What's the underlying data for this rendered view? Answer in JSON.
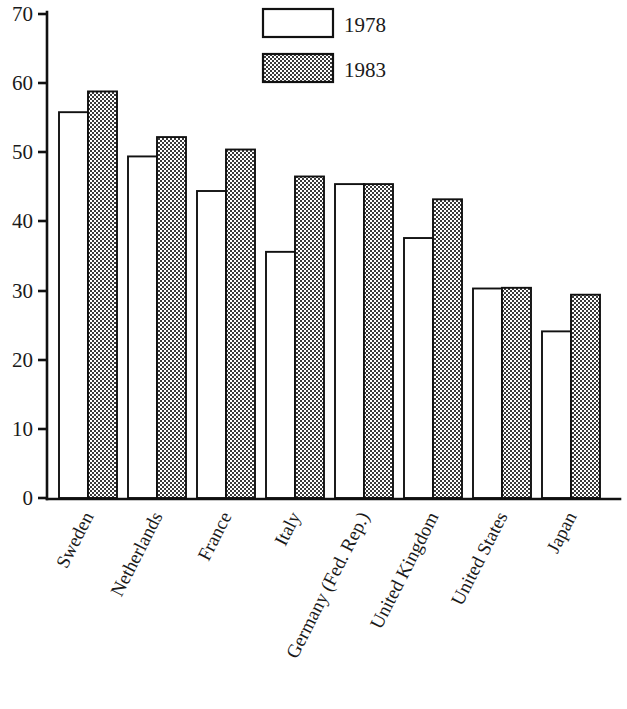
{
  "chart_data": {
    "type": "bar",
    "title": "",
    "subtitle": "",
    "xlabel": "",
    "ylabel": "",
    "ylim": [
      0,
      70
    ],
    "yticks": [
      0,
      10,
      20,
      30,
      40,
      50,
      60,
      70
    ],
    "ytick_labels": [
      "0",
      "10",
      "20",
      "30",
      "40",
      "50",
      "60",
      "70"
    ],
    "grid": false,
    "legend_position": "top-center",
    "categories": [
      "Sweden",
      "Netherlands",
      "France",
      "Italy",
      "Germany (Fed. Rep.)",
      "United Kingdom",
      "United States",
      "Japan"
    ],
    "series": [
      {
        "name": "1978",
        "pattern": "empty",
        "values": [
          55.8,
          49.4,
          44.4,
          35.6,
          45.4,
          37.6,
          30.3,
          24.1
        ]
      },
      {
        "name": "1983",
        "pattern": "stipple",
        "values": [
          58.8,
          52.2,
          50.4,
          46.5,
          45.4,
          43.2,
          30.4,
          29.4
        ]
      }
    ],
    "colors": {
      "axis": "#111111",
      "bar_outline": "#111111",
      "series_1978_fill": "#ffffff",
      "series_1983_fill": "#cccccc",
      "background": "#ffffff"
    }
  },
  "legend": {
    "items": [
      {
        "label": "1978",
        "swatch": "empty-swatch"
      },
      {
        "label": "1983",
        "swatch": "stipple-swatch"
      }
    ]
  },
  "axis": {
    "y_ticks": [
      {
        "label": "70"
      },
      {
        "label": "60"
      },
      {
        "label": "50"
      },
      {
        "label": "40"
      },
      {
        "label": "30"
      },
      {
        "label": "20"
      },
      {
        "label": "10"
      },
      {
        "label": "0"
      }
    ]
  },
  "categories": [
    {
      "label": "Sweden"
    },
    {
      "label": "Netherlands"
    },
    {
      "label": "France"
    },
    {
      "label": "Italy"
    },
    {
      "label": "Germany (Fed. Rep.)"
    },
    {
      "label": "United Kingdom"
    },
    {
      "label": "United States"
    },
    {
      "label": "Japan"
    }
  ]
}
